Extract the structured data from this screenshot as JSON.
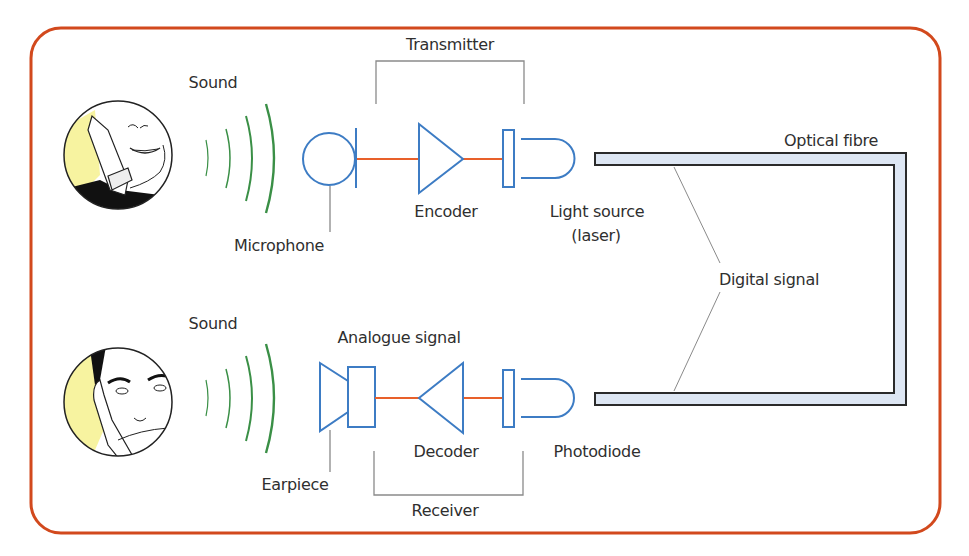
{
  "colors": {
    "frame": "#d2491d",
    "component_stroke": "#3d7cc4",
    "wire": "#e8602a",
    "sound_wave": "#3a8f46",
    "fibre_fill": "#dde6f3",
    "fibre_stroke": "#2a2a2a",
    "leader_line": "#8a8a8a",
    "skin_highlight": "#f7f3a0"
  },
  "transmit_side": {
    "sound_label": "Sound",
    "microphone_label": "Microphone",
    "encoder_label": "Encoder",
    "light_source_label": "Light source",
    "light_source_sublabel": "(laser)",
    "group_label": "Transmitter"
  },
  "receive_side": {
    "sound_label": "Sound",
    "earpiece_label": "Earpiece",
    "analogue_label": "Analogue signal",
    "decoder_label": "Decoder",
    "photodiode_label": "Photodiode",
    "group_label": "Receiver"
  },
  "fibre": {
    "label": "Optical fibre",
    "signal_label": "Digital signal"
  }
}
